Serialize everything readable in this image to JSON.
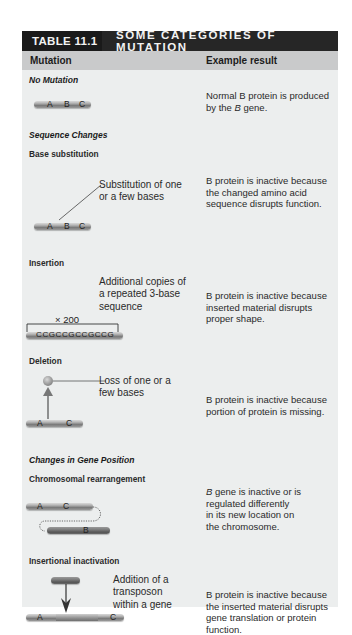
{
  "table": {
    "number": "TABLE 11.1",
    "title": "SOME CATEGORIES OF MUTATION",
    "columns": {
      "mutation": "Mutation",
      "result": "Example result"
    },
    "colors": {
      "title_bg": "#1c1c1c",
      "header_bg": "#c9cacb",
      "body_bg": "#eceeee"
    }
  },
  "rows": [
    {
      "category": "No Mutation",
      "diagram_labels": [
        "A",
        "B",
        "C"
      ],
      "result": [
        "Normal B protein is produced",
        "by the "
      ],
      "result_italic": "B",
      "result_tail": " gene."
    },
    {
      "category": "Sequence Changes"
    },
    {
      "type": "Base substitution",
      "note": [
        "Substitution of one",
        "or a few bases"
      ],
      "diagram_labels": [
        "A",
        "B",
        "C"
      ],
      "result": [
        "B protein is inactive because",
        "the changed amino acid",
        "sequence disrupts function."
      ]
    },
    {
      "type": "Insertion",
      "note": [
        "Additional copies of",
        "a repeated 3-base",
        "sequence"
      ],
      "repeat_label": "× 200",
      "sequence": "CCGCCGCCGCCG",
      "result": [
        "B protein is inactive because",
        "inserted material disrupts",
        "proper shape."
      ]
    },
    {
      "type": "Deletion",
      "note": [
        "Loss of one or  a",
        "few bases"
      ],
      "diagram_labels": [
        "A",
        "C"
      ],
      "result": [
        "B protein is inactive because",
        "portion of protein is missing."
      ]
    },
    {
      "category": "Changes in Gene Position"
    },
    {
      "type": "Chromosomal rearrangement",
      "diagram_labels": [
        "A",
        "C",
        "B"
      ],
      "result_italic": "B",
      "result": [
        " gene is inactive or is",
        "regulated differently",
        "in its new location on",
        "the chromosome."
      ]
    },
    {
      "type": "Insertional inactivation",
      "note": [
        "Addition of a",
        "transposon",
        "within a gene"
      ],
      "diagram_labels": [
        "A",
        "C"
      ],
      "result": [
        "B protein is inactive because",
        "the inserted material disrupts",
        "gene translation or protein",
        "function."
      ]
    }
  ]
}
